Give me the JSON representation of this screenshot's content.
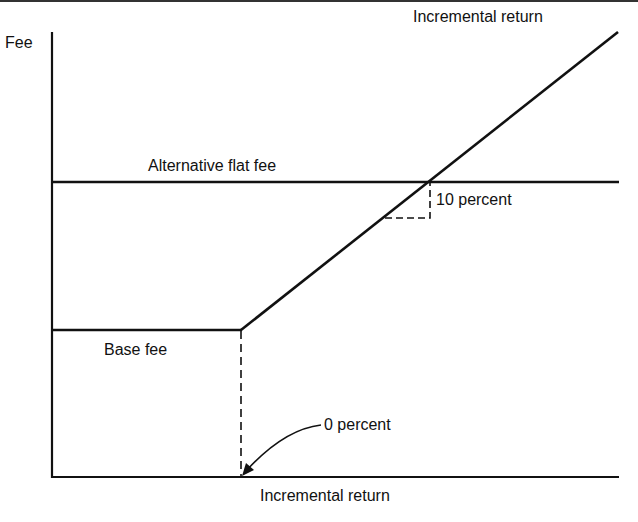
{
  "diagram": {
    "y_axis_label": "Fee",
    "x_axis_label": "Incremental return",
    "line_label": "Incremental return",
    "flat_fee_label": "Alternative flat fee",
    "base_fee_label": "Base fee",
    "slope_label": "10 percent",
    "zero_label": "0 percent",
    "colors": {
      "line": "#111111",
      "background": "#ffffff"
    }
  }
}
